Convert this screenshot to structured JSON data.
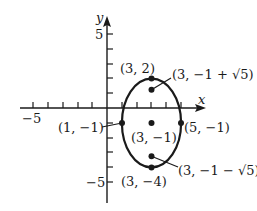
{
  "diagram": {
    "type": "ellipse-graph",
    "axes": {
      "x_label": "x",
      "y_label": "y",
      "x_range": [
        -6,
        6.5
      ],
      "y_range": [
        -6.5,
        7
      ],
      "x_tick_label_neg": "−5",
      "y_tick_label_pos": "5",
      "y_tick_label_neg": "−5"
    },
    "ellipse": {
      "center": [
        3,
        -1
      ],
      "semi_major_vertical": 3,
      "semi_minor_horizontal": 2,
      "equation_hint": "(x−3)²/4 + (y+1)²/9 = 1"
    },
    "points": [
      {
        "name": "top-vertex",
        "x": 3,
        "y": 2,
        "label": "(3, 2)"
      },
      {
        "name": "upper-focus",
        "x": 3,
        "y": 1.236,
        "label": "(3, −1 + √5)"
      },
      {
        "name": "center",
        "x": 3,
        "y": -1,
        "label": "(3, −1)"
      },
      {
        "name": "left-vertex",
        "x": 1,
        "y": -1,
        "label": "(1, −1)"
      },
      {
        "name": "right-vertex",
        "x": 5,
        "y": -1,
        "label": "(5, −1)"
      },
      {
        "name": "lower-focus",
        "x": 3,
        "y": -3.236,
        "label": "(3, −1 − √5)"
      },
      {
        "name": "bottom-vertex",
        "x": 3,
        "y": -4,
        "label": "(3, −4)"
      }
    ],
    "colors": {
      "stroke": "#1a1a1a",
      "background": "#ffffff"
    }
  }
}
